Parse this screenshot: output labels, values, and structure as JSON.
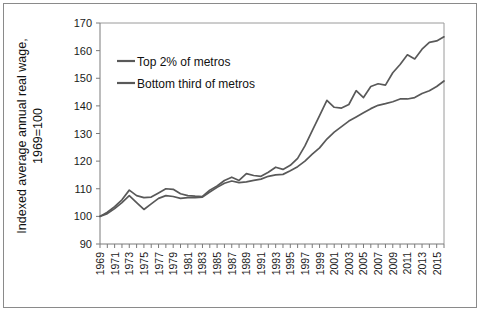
{
  "chart_data": {
    "type": "line",
    "title": "",
    "xlabel": "",
    "ylabel": "Indexed average annual real wage, 1969=100",
    "ylabel_line1": "Indexed average annual real wage,",
    "ylabel_line2": "1969=100",
    "ylim": [
      90,
      170
    ],
    "y_ticks": [
      90,
      100,
      110,
      120,
      130,
      140,
      150,
      160,
      170
    ],
    "xlim": [
      1969,
      2016
    ],
    "x_tick_labels": [
      "1969",
      "1971",
      "1973",
      "1975",
      "1977",
      "1979",
      "1981",
      "1983",
      "1985",
      "1987",
      "1989",
      "1991",
      "1993",
      "1995",
      "1997",
      "1999",
      "2001",
      "2003",
      "2005",
      "2007",
      "2009",
      "2011",
      "2013",
      "2015"
    ],
    "grid": false,
    "legend_position": "upper-left-inside",
    "x": [
      1969,
      1970,
      1971,
      1972,
      1973,
      1974,
      1975,
      1976,
      1977,
      1978,
      1979,
      1980,
      1981,
      1982,
      1983,
      1984,
      1985,
      1986,
      1987,
      1988,
      1989,
      1990,
      1991,
      1992,
      1993,
      1994,
      1995,
      1996,
      1997,
      1998,
      1999,
      2000,
      2001,
      2002,
      2003,
      2004,
      2005,
      2006,
      2007,
      2008,
      2009,
      2010,
      2011,
      2012,
      2013,
      2014,
      2015,
      2016
    ],
    "series": [
      {
        "name": "Top 2% of metros",
        "color": "#595959",
        "values": [
          100.0,
          101.5,
          103.5,
          106.0,
          109.5,
          107.5,
          106.8,
          107.0,
          108.5,
          110.0,
          109.8,
          108.2,
          107.5,
          107.3,
          107.2,
          109.5,
          111.0,
          113.0,
          114.2,
          113.0,
          115.5,
          114.8,
          114.5,
          116.0,
          117.8,
          117.0,
          118.5,
          121.0,
          125.5,
          131.0,
          136.5,
          142.0,
          139.5,
          139.2,
          140.5,
          145.5,
          143.0,
          147.0,
          148.0,
          147.5,
          152.0,
          155.0,
          158.5,
          157.0,
          160.5,
          163.0,
          163.5,
          165.0
        ]
      },
      {
        "name": "Bottom third of metros",
        "color": "#595959",
        "values": [
          100.0,
          101.0,
          102.8,
          105.0,
          107.5,
          105.0,
          102.5,
          104.5,
          106.5,
          107.5,
          107.2,
          106.5,
          106.8,
          106.8,
          107.0,
          108.8,
          110.5,
          112.0,
          112.8,
          112.2,
          112.5,
          113.0,
          113.5,
          114.5,
          115.0,
          115.2,
          116.5,
          118.0,
          120.0,
          122.5,
          124.8,
          128.0,
          130.5,
          132.5,
          134.5,
          136.0,
          137.5,
          139.0,
          140.2,
          140.8,
          141.5,
          142.5,
          142.5,
          143.0,
          144.5,
          145.5,
          147.0,
          149.0
        ]
      }
    ],
    "legend_entries": [
      "Top 2% of metros",
      "Bottom third of metros"
    ]
  }
}
